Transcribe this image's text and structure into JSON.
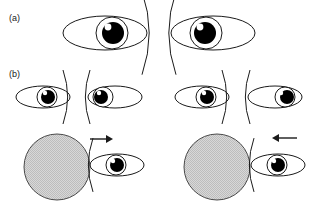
{
  "figure": {
    "type": "line-drawing-diagram",
    "background_color": "#ffffff",
    "stroke_color": "#1a1a1a",
    "pupil_color": "#000000",
    "highlight_color": "#ffffff",
    "disc_fill_color": "#c9c9c9",
    "disc_stroke_color": "#4a4a4a",
    "width": 319,
    "height": 205
  },
  "panels": [
    {
      "id": "a",
      "label": "(a)",
      "label_x": 9,
      "label_y": 13,
      "items": [
        {
          "name": "eye-a-left",
          "cx": 105,
          "cy": 33,
          "rx": 42,
          "ry": 17,
          "iris_cx": 112,
          "iris_r": 16,
          "pupil_cx": 113,
          "pupil_r": 11,
          "highlight_cx": 108,
          "highlight_cy": 27,
          "highlight_r": 3.4,
          "arc_side": "right",
          "arc_x": 142,
          "gaze": "right"
        },
        {
          "name": "eye-a-right",
          "cx": 213,
          "cy": 33,
          "rx": 42,
          "ry": 17,
          "iris_cx": 206,
          "iris_r": 16,
          "pupil_cx": 205,
          "pupil_r": 11,
          "highlight_cx": 200,
          "highlight_cy": 27,
          "highlight_r": 3.4,
          "arc_side": "left",
          "arc_x": 176,
          "gaze": "left"
        }
      ]
    },
    {
      "id": "b",
      "label": "(b)",
      "label_x": 9,
      "label_y": 69,
      "rows": [
        {
          "name": "row-eyes",
          "items": [
            {
              "name": "eye-b1-left",
              "cx": 43,
              "cy": 97,
              "rx": 27,
              "ry": 11,
              "iris_cx": 47,
              "iris_r": 10,
              "pupil_cx": 48,
              "pupil_r": 7,
              "highlight_cx": 45,
              "highlight_cy": 93,
              "highlight_r": 2.2,
              "arc_side": "right",
              "arc_x": 63,
              "gaze": "right"
            },
            {
              "name": "eye-b1-right",
              "cx": 115,
              "cy": 97,
              "rx": 27,
              "ry": 11,
              "iris_cx": 103,
              "iris_r": 10,
              "pupil_cx": 101,
              "pupil_r": 7,
              "highlight_cx": 99,
              "highlight_cy": 93,
              "highlight_r": 2.2,
              "arc_side": "left",
              "arc_x": 90,
              "gaze": "far-left"
            },
            {
              "name": "eye-b2-left",
              "cx": 202,
              "cy": 97,
              "rx": 27,
              "ry": 11,
              "iris_cx": 206,
              "iris_r": 10,
              "pupil_cx": 207,
              "pupil_r": 7,
              "highlight_cx": 204,
              "highlight_cy": 93,
              "highlight_r": 2.2,
              "arc_side": "right",
              "arc_x": 222,
              "gaze": "right"
            },
            {
              "name": "eye-b2-right",
              "cx": 275,
              "cy": 97,
              "rx": 27,
              "ry": 11,
              "iris_cx": 285,
              "iris_r": 10,
              "pupil_cx": 287,
              "pupil_r": 7,
              "highlight_cx": 281,
              "highlight_cy": 93,
              "highlight_r": 2.2,
              "arc_side": "left",
              "arc_x": 250,
              "gaze": "far-right"
            }
          ]
        },
        {
          "name": "row-discs",
          "items": [
            {
              "name": "disc-left",
              "cx": 57,
              "cy": 167,
              "r": 33
            },
            {
              "name": "arrow-left",
              "direction": "right",
              "x1": 90,
              "x2": 113,
              "y": 139
            },
            {
              "name": "eye-b3-left",
              "cx": 117,
              "cy": 165,
              "rx": 27,
              "ry": 11,
              "iris_cx": 116,
              "iris_r": 10,
              "pupil_cx": 117,
              "pupil_r": 7,
              "highlight_cx": 113,
              "highlight_cy": 161,
              "highlight_r": 2.2,
              "arc_side": "left",
              "arc_x": 93,
              "gaze": "center"
            },
            {
              "name": "disc-right",
              "cx": 217,
              "cy": 167,
              "r": 33
            },
            {
              "name": "arrow-right",
              "direction": "left",
              "x1": 297,
              "x2": 272,
              "y": 138
            },
            {
              "name": "eye-b3-right",
              "cx": 278,
              "cy": 165,
              "rx": 27,
              "ry": 11,
              "iris_cx": 277,
              "iris_r": 10,
              "pupil_cx": 278,
              "pupil_r": 7,
              "highlight_cx": 274,
              "highlight_cy": 161,
              "highlight_r": 2.2,
              "arc_side": "left",
              "arc_x": 254,
              "gaze": "center"
            }
          ]
        }
      ]
    }
  ]
}
